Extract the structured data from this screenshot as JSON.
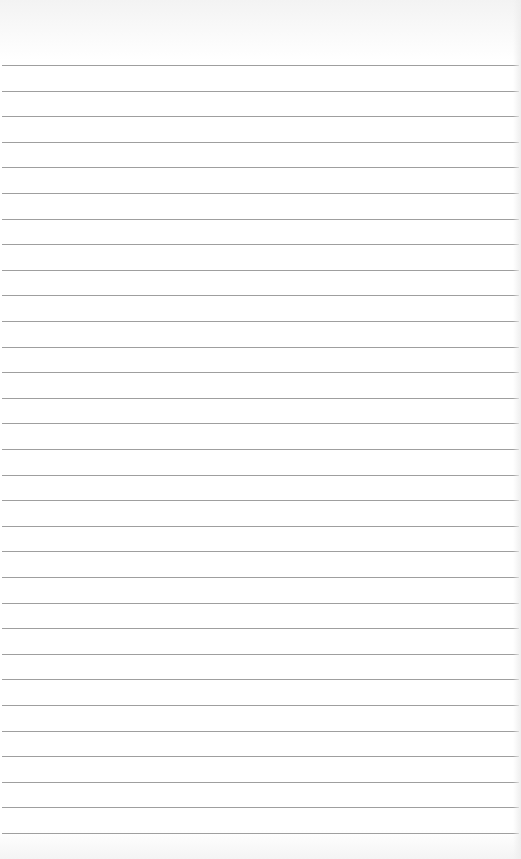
{
  "paper": {
    "background": "#ffffff",
    "rule_color": "#8e8e8e",
    "first_rule_y": 65,
    "rule_spacing": 25.6,
    "rule_count": 31
  }
}
